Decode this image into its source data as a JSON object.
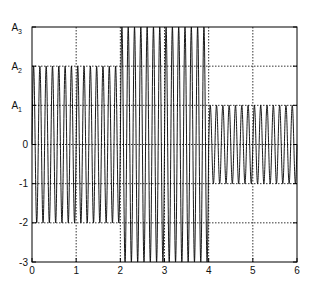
{
  "chart_data": {
    "type": "line",
    "title": "",
    "xlabel": "",
    "ylabel": "",
    "xlim": [
      0,
      6
    ],
    "ylim": [
      -3,
      3
    ],
    "grid": true,
    "grid_style": "dotted",
    "x_ticks": [
      0,
      1,
      2,
      3,
      4,
      5,
      6
    ],
    "x_tick_labels": [
      "0",
      "1",
      "2",
      "3",
      "4",
      "5",
      "6"
    ],
    "y_ticks": [
      3,
      2,
      1,
      0,
      -1,
      -2,
      -3
    ],
    "y_tick_labels": [
      {
        "base": "A",
        "sub": "3"
      },
      {
        "base": "A",
        "sub": "2"
      },
      {
        "base": "A",
        "sub": "1"
      },
      {
        "base": "0",
        "sub": ""
      },
      {
        "base": "-1",
        "sub": ""
      },
      {
        "base": "-2",
        "sub": ""
      },
      {
        "base": "-3",
        "sub": ""
      }
    ],
    "cycles_per_unit": 7,
    "series": [
      {
        "name": "signal",
        "segments": [
          {
            "x_start": 0,
            "x_end": 2,
            "amplitude": 2
          },
          {
            "x_start": 2,
            "x_end": 4,
            "amplitude": 3
          },
          {
            "x_start": 4,
            "x_end": 6,
            "amplitude": 1
          }
        ],
        "color": "#000000"
      }
    ]
  },
  "colors": {
    "line": "#000000",
    "grid": "#000000",
    "axis": "#000000",
    "background": "#ffffff"
  }
}
